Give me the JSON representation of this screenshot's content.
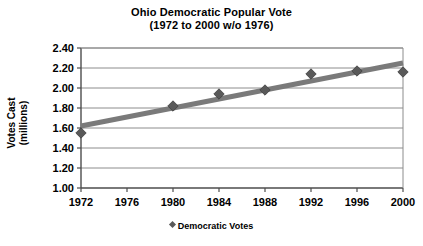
{
  "chart_data": {
    "type": "line",
    "title": "Ohio Democratic Popular Vote",
    "subtitle": "(1972 to 2000 w/o 1976)",
    "xlabel": "",
    "ylabel": "Votes Cast",
    "ylabel_line2": "(millions)",
    "xlim": [
      1972,
      2000
    ],
    "ylim": [
      1.0,
      2.4
    ],
    "grid": true,
    "legend_position": "bottom",
    "xticks": [
      "1972",
      "1976",
      "1980",
      "1984",
      "1988",
      "1992",
      "1996",
      "2000"
    ],
    "xtick_values": [
      1972,
      1976,
      1980,
      1984,
      1988,
      1992,
      1996,
      2000
    ],
    "yticks": [
      "1.00",
      "1.20",
      "1.40",
      "1.60",
      "1.80",
      "2.00",
      "2.20",
      "2.40"
    ],
    "ytick_values": [
      1.0,
      1.2,
      1.4,
      1.6,
      1.8,
      2.0,
      2.2,
      2.4
    ],
    "series": [
      {
        "name": "Democratic Votes",
        "marker": "diamond",
        "color": "#595959",
        "x": [
          1972,
          1980,
          1984,
          1988,
          1992,
          1996,
          2000
        ],
        "values": [
          1.55,
          1.82,
          1.94,
          1.98,
          2.14,
          2.17,
          2.16
        ]
      }
    ],
    "trendline": {
      "name": "linear trend",
      "color": "#7a7a7a",
      "x": [
        1972,
        2000
      ],
      "values": [
        1.62,
        2.25
      ]
    },
    "legend": [
      {
        "label": "Democratic Votes",
        "marker": "diamond",
        "color": "#595959"
      }
    ]
  },
  "colors": {
    "axis": "#4d4d4d",
    "grid": "#8c8c8c",
    "marker": "#595959",
    "trend": "#7a7a7a",
    "text": "#000000",
    "background": "#ffffff"
  }
}
